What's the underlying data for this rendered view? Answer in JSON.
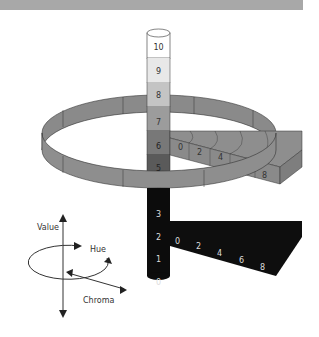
{
  "diagram": {
    "value_scale": {
      "labels": [
        "0",
        "1",
        "2",
        "3",
        "4",
        "5",
        "6",
        "7",
        "8",
        "9",
        "10"
      ],
      "visible_labels": [
        "10",
        "9",
        "8",
        "7",
        "6",
        "5",
        "3",
        "2",
        "1",
        "0"
      ],
      "fills": [
        "#0a0a0a",
        "#0f0f0f",
        "#151515",
        "#1c1c1c",
        "#2a2a2a",
        "#5a5a5a",
        "#7a7a7a",
        "#9c9c9c",
        "#c4c4c4",
        "#e6e6e6",
        "#ffffff"
      ]
    },
    "chroma_scale_upper": {
      "value_level": "6",
      "labels": [
        "0",
        "2",
        "4",
        "8"
      ],
      "fill": "#8e8e8e"
    },
    "chroma_scale_lower": {
      "value_level": "2",
      "labels": [
        "0",
        "2",
        "4",
        "6",
        "8"
      ],
      "fill": "#0e0e0e"
    },
    "hue_ring": {
      "fill": "#8e8e8e",
      "edge": "#333333"
    },
    "legend": {
      "value_label": "Value",
      "hue_label": "Hue",
      "chroma_label": "Chroma"
    },
    "colors": {
      "top_band": "#a8a8a8",
      "background": "#ffffff"
    }
  }
}
